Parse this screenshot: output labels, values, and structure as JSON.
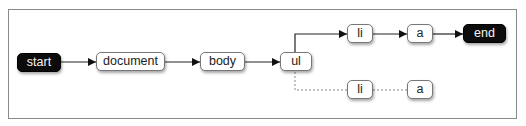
{
  "diagram": {
    "type": "dom-traversal-flow",
    "nodes": [
      {
        "id": "start",
        "label": "start",
        "style": "dark"
      },
      {
        "id": "document",
        "label": "document",
        "style": "light"
      },
      {
        "id": "body",
        "label": "body",
        "style": "light"
      },
      {
        "id": "ul",
        "label": "ul",
        "style": "light"
      },
      {
        "id": "li1",
        "label": "li",
        "style": "light"
      },
      {
        "id": "a1",
        "label": "a",
        "style": "light"
      },
      {
        "id": "end",
        "label": "end",
        "style": "dark"
      },
      {
        "id": "li2",
        "label": "li",
        "style": "light"
      },
      {
        "id": "a2",
        "label": "a",
        "style": "light"
      }
    ],
    "edges": [
      {
        "from": "start",
        "to": "document",
        "style": "solid-arrow"
      },
      {
        "from": "document",
        "to": "body",
        "style": "solid-arrow"
      },
      {
        "from": "body",
        "to": "ul",
        "style": "solid-arrow"
      },
      {
        "from": "ul",
        "to": "li1",
        "style": "solid-arrow"
      },
      {
        "from": "li1",
        "to": "a1",
        "style": "solid-arrow"
      },
      {
        "from": "a1",
        "to": "end",
        "style": "solid-arrow"
      },
      {
        "from": "ul",
        "to": "li2",
        "style": "dotted"
      },
      {
        "from": "li2",
        "to": "a2",
        "style": "dotted"
      }
    ]
  }
}
